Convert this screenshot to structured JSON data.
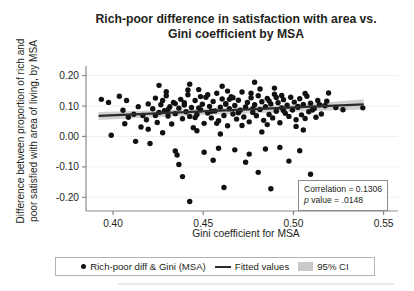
{
  "figure": {
    "title": "Rich-poor difference in satisfaction with area vs. Gini coefficient by MSA",
    "title_line1": "Rich-poor difference in satisfaction with area vs.",
    "title_line2": "Gini coefficient by MSA",
    "ylabel_line1": "Difference between proportion of rich and",
    "ylabel_line2": "poor satisfied with area of living, by MSA",
    "xlabel": "Gini coefficient for MSA"
  },
  "annotation": {
    "correlation_label": "Correlation = 0.1306",
    "p_italic": "p",
    "p_rest": " value = .0148"
  },
  "legend": {
    "scatter_label": "Rich-poor diff & Gini (MSA)",
    "fit_label": "Fitted values",
    "ci_label": "95% CI"
  },
  "colors": {
    "point": "#111111",
    "fit_line": "#2b2b2b",
    "ci_band": "#c9c9c9",
    "axis": "#8a8a8a",
    "grid": "#f0f0f0",
    "text": "#231f20"
  },
  "chart_data": {
    "type": "scatter",
    "title": "Rich-poor difference in satisfaction with area vs. Gini coefficient by MSA",
    "xlabel": "Gini coefficient for MSA",
    "ylabel": "Difference between proportion of rich and poor satisfied with area of living, by MSA",
    "xlim": [
      0.385,
      0.558
    ],
    "ylim": [
      -0.245,
      0.225
    ],
    "xticks": [
      0.4,
      0.45,
      0.5,
      0.55
    ],
    "xticklabels": [
      "0.40",
      "0.45",
      "0.50",
      "0.55"
    ],
    "yticks": [
      0.2,
      0.1,
      0.0,
      -0.1,
      -0.2
    ],
    "yticklabels": [
      "0.20",
      "0.10",
      "0.00",
      "-0.10",
      "-0.20"
    ],
    "grid": "horizontal-faint",
    "legend_position": "below-axes",
    "correlation": 0.1306,
    "p_value": 0.0148,
    "series": [
      {
        "name": "Rich-poor diff & Gini (MSA)",
        "type": "scatter",
        "marker": "filled-circle",
        "color": "#111111",
        "points": [
          [
            0.3935,
            0.122
          ],
          [
            0.3975,
            0.112
          ],
          [
            0.399,
            0.004
          ],
          [
            0.4035,
            0.132
          ],
          [
            0.4055,
            0.086
          ],
          [
            0.4075,
            0.118
          ],
          [
            0.4085,
            0.063
          ],
          [
            0.4115,
            0.073
          ],
          [
            0.4125,
            -0.016
          ],
          [
            0.414,
            0.098
          ],
          [
            0.4165,
            0.069
          ],
          [
            0.4185,
            0.055
          ],
          [
            0.4195,
            0.107
          ],
          [
            0.4205,
            -0.023
          ],
          [
            0.422,
            0.091
          ],
          [
            0.4235,
            0.126
          ],
          [
            0.4245,
            0.046
          ],
          [
            0.4255,
            0.079
          ],
          [
            0.4265,
            0.104
          ],
          [
            0.4275,
            0.012
          ],
          [
            0.4285,
            0.085
          ],
          [
            0.4295,
            0.134
          ],
          [
            0.4305,
            0.067
          ],
          [
            0.4315,
            0.098
          ],
          [
            0.4325,
            0.041
          ],
          [
            0.4335,
            0.112
          ],
          [
            0.4345,
            0.075
          ],
          [
            0.4355,
            -0.061
          ],
          [
            0.4365,
            0.093
          ],
          [
            0.4375,
            0.122
          ],
          [
            0.4385,
            0.058
          ],
          [
            0.4395,
            0.103
          ],
          [
            0.4405,
            0.081
          ],
          [
            0.4415,
            0.137
          ],
          [
            0.4425,
            0.066
          ],
          [
            0.4435,
            0.095
          ],
          [
            0.4445,
            0.029
          ],
          [
            0.4455,
            0.118
          ],
          [
            0.4465,
            0.072
          ],
          [
            0.4475,
            0.154
          ],
          [
            0.4485,
            0.088
          ],
          [
            0.4495,
            0.106
          ],
          [
            0.4505,
            0.043
          ],
          [
            0.4515,
            0.129
          ],
          [
            0.4525,
            0.077
          ],
          [
            0.4535,
            0.099
          ],
          [
            0.4545,
            0.061
          ],
          [
            0.4555,
            0.115
          ],
          [
            0.4565,
            0.084
          ],
          [
            0.4575,
            0.142
          ],
          [
            0.4585,
            0.052
          ],
          [
            0.4595,
            0.096
          ],
          [
            0.4605,
            0.123
          ],
          [
            0.4615,
            0.069
          ],
          [
            0.4625,
            0.108
          ],
          [
            0.4635,
            0.035
          ],
          [
            0.4645,
            0.091
          ],
          [
            0.4655,
            0.131
          ],
          [
            0.4665,
            0.074
          ],
          [
            0.4675,
            0.102
          ],
          [
            0.4685,
            0.057
          ],
          [
            0.4695,
            0.119
          ],
          [
            0.4705,
            0.086
          ],
          [
            0.4715,
            0.146
          ],
          [
            0.4725,
            0.064
          ],
          [
            0.4735,
            0.097
          ],
          [
            0.4745,
            0.112
          ],
          [
            0.4755,
            0.048
          ],
          [
            0.4765,
            0.127
          ],
          [
            0.4775,
            0.079
          ],
          [
            0.4785,
            0.104
          ],
          [
            0.4795,
            0.068
          ],
          [
            0.4805,
            0.134
          ],
          [
            0.4815,
            0.089
          ],
          [
            0.4825,
            0.114
          ],
          [
            0.4835,
            0.053
          ],
          [
            0.4845,
            0.098
          ],
          [
            0.4855,
            0.125
          ],
          [
            0.4865,
            0.072
          ],
          [
            0.4875,
            0.107
          ],
          [
            0.4885,
            0.061
          ],
          [
            0.4895,
            0.139
          ],
          [
            0.4905,
            0.083
          ],
          [
            0.4915,
            0.111
          ],
          [
            0.4925,
            0.045
          ],
          [
            0.4935,
            0.094
          ],
          [
            0.4945,
            0.121
          ],
          [
            0.4955,
            0.076
          ],
          [
            0.4965,
            0.103
          ],
          [
            0.4975,
            0.066
          ],
          [
            0.4985,
            0.129
          ],
          [
            0.4995,
            0.087
          ],
          [
            0.5005,
            0.113
          ],
          [
            0.5015,
            0.055
          ],
          [
            0.5025,
            0.096
          ],
          [
            0.5035,
            0.124
          ],
          [
            0.5045,
            0.071
          ],
          [
            0.5055,
            0.105
          ],
          [
            0.5065,
            0.059
          ],
          [
            0.5075,
            0.132
          ],
          [
            0.5085,
            0.081
          ],
          [
            0.5095,
            0.109
          ],
          [
            0.5115,
            0.092
          ],
          [
            0.5135,
            0.118
          ],
          [
            0.5155,
            0.074
          ],
          [
            0.5175,
            0.101
          ],
          [
            0.5195,
            0.143
          ],
          [
            0.5235,
            0.095
          ],
          [
            0.5275,
            0.088
          ],
          [
            0.5385,
            0.094
          ],
          [
            0.4255,
            0.168
          ],
          [
            0.4425,
            0.172
          ],
          [
            0.4605,
            0.165
          ],
          [
            0.4785,
            0.178
          ],
          [
            0.4895,
            0.159
          ],
          [
            0.4415,
            0.153
          ],
          [
            0.4635,
            0.149
          ],
          [
            0.4815,
            0.156
          ],
          [
            0.4345,
            -0.048
          ],
          [
            0.4505,
            -0.052
          ],
          [
            0.4585,
            -0.039
          ],
          [
            0.4675,
            -0.044
          ],
          [
            0.4755,
            -0.058
          ],
          [
            0.4845,
            -0.041
          ],
          [
            0.4925,
            -0.036
          ],
          [
            0.5035,
            -0.047
          ],
          [
            0.4365,
            -0.092
          ],
          [
            0.4555,
            -0.078
          ],
          [
            0.4735,
            -0.085
          ],
          [
            0.4975,
            -0.081
          ],
          [
            0.4385,
            -0.132
          ],
          [
            0.4805,
            -0.118
          ],
          [
            0.5095,
            -0.124
          ],
          [
            0.4615,
            -0.168
          ],
          [
            0.4875,
            -0.172
          ],
          [
            0.4425,
            -0.214
          ],
          [
            0.4065,
            0.042
          ],
          [
            0.4155,
            0.031
          ],
          [
            0.4275,
            0.118
          ],
          [
            0.4345,
            0.108
          ],
          [
            0.4455,
            0.062
          ],
          [
            0.4525,
            0.137
          ],
          [
            0.4575,
            0.043
          ],
          [
            0.4665,
            0.127
          ],
          [
            0.4715,
            0.036
          ],
          [
            0.4765,
            0.142
          ],
          [
            0.4855,
            0.039
          ],
          [
            0.4935,
            0.135
          ],
          [
            0.5015,
            0.033
          ],
          [
            0.5065,
            0.141
          ],
          [
            0.5125,
            0.063
          ],
          [
            0.5185,
            0.116
          ],
          [
            0.4235,
            0.069
          ],
          [
            0.4305,
            0.089
          ],
          [
            0.4395,
            0.111
          ],
          [
            0.4475,
            0.094
          ],
          [
            0.4545,
            0.083
          ],
          [
            0.4625,
            0.106
          ],
          [
            0.4695,
            0.078
          ],
          [
            0.4775,
            0.091
          ],
          [
            0.4865,
            0.117
          ],
          [
            0.4945,
            0.085
          ],
          [
            0.5025,
            0.099
          ],
          [
            0.5105,
            0.087
          ],
          [
            0.4195,
            0.024
          ],
          [
            0.4465,
            0.019
          ],
          [
            0.4595,
            0.008
          ],
          [
            0.4825,
            0.015
          ],
          [
            0.5055,
            0.021
          ],
          [
            0.4295,
            0.147
          ],
          [
            0.4485,
            0.131
          ],
          [
            0.4645,
            0.122
          ],
          [
            0.4905,
            0.128
          ],
          [
            0.5145,
            0.104
          ]
        ]
      },
      {
        "name": "Fitted values",
        "type": "line",
        "color": "#2b2b2b",
        "x": [
          0.392,
          0.539
        ],
        "y": [
          0.0675,
          0.1055
        ],
        "slope": 0.2585,
        "intercept": -0.0338
      },
      {
        "name": "95% CI",
        "type": "band",
        "color": "#c9c9c9",
        "x": [
          0.392,
          0.42,
          0.45,
          0.48,
          0.51,
          0.539
        ],
        "upper": [
          0.0805,
          0.0855,
          0.0915,
          0.0985,
          0.1085,
          0.1225
        ],
        "lower": [
          0.0545,
          0.0625,
          0.0705,
          0.0765,
          0.0835,
          0.0885
        ]
      }
    ]
  }
}
